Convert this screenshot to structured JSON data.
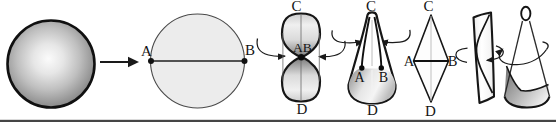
{
  "figure": {
    "shapes": {
      "disk": {
        "label_a": "A",
        "label_b": "B"
      },
      "hourglass": {
        "label_c": "C",
        "label_ab": "AB",
        "label_d": "D"
      },
      "teardrop": {
        "label_c": "C",
        "label_a": "A",
        "label_b": "B",
        "label_d": "D"
      },
      "diamond": {
        "label_c": "C",
        "label_a": "A",
        "label_b": "B",
        "label_d": "D"
      }
    },
    "colors": {
      "ink": "#1a1a1a",
      "disk_fill": "#ececec",
      "sphere_edge": "#858585",
      "shade_mid": "#8c8c8c",
      "background": "#ffffff"
    }
  }
}
